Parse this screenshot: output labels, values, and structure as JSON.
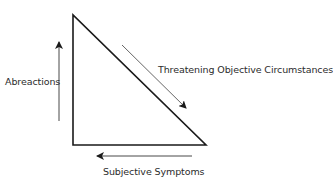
{
  "diagram": {
    "type": "triangle-cycle",
    "labels": {
      "left": "Abreactions",
      "diagonal": "Threatening Objective Circumstances",
      "bottom": "Subjective Symptoms"
    },
    "colors": {
      "triangle_stroke": "#1a1a1a",
      "arrow_stroke": "#333333",
      "text": "#2b2b2b",
      "background": "#ffffff"
    },
    "arrows": [
      {
        "id": "left",
        "direction": "up",
        "label": "Abreactions"
      },
      {
        "id": "diagonal",
        "direction": "down-right",
        "label": "Threatening Objective Circumstances"
      },
      {
        "id": "bottom",
        "direction": "left",
        "label": "Subjective Symptoms"
      }
    ]
  }
}
